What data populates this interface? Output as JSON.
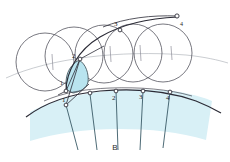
{
  "figure": {
    "caption": "B",
    "colors": {
      "stroke_dark": "#2b2b36",
      "stroke_circle": "#555560",
      "stroke_light": "#9aa0a6",
      "fill_sector": "#d8f0f6",
      "fill_small_region": "#b9e4ef",
      "node_fill": "#ffffff",
      "background": "#ffffff"
    },
    "base_curve_labels": [
      {
        "text": "1",
        "x": 62,
        "y": 101
      },
      {
        "text": "2",
        "x": 109,
        "y": 99
      },
      {
        "text": "3",
        "x": 139,
        "y": 98
      },
      {
        "text": "4",
        "x": 166,
        "y": 98
      }
    ],
    "upper_curve_labels": [
      {
        "text": "1",
        "x": 60,
        "y": 83
      },
      {
        "text": "2",
        "x": 72,
        "y": 56
      },
      {
        "text": "3",
        "x": 115,
        "y": 24
      },
      {
        "text": "4",
        "x": 181,
        "y": 27
      }
    ],
    "base_nodes": [
      {
        "name": "node-0",
        "x": 65,
        "y": 105
      },
      {
        "name": "node-1",
        "x": 90,
        "y": 93
      },
      {
        "name": "node-2",
        "x": 116,
        "y": 91
      },
      {
        "name": "node-3",
        "x": 143,
        "y": 91
      },
      {
        "name": "node-4",
        "x": 170,
        "y": 92
      }
    ],
    "upper_nodes": [
      {
        "name": "upper-node-1",
        "x": 66,
        "y": 90
      },
      {
        "name": "upper-node-2",
        "x": 79,
        "y": 59
      },
      {
        "name": "upper-node-3",
        "x": 120,
        "y": 30
      },
      {
        "name": "upper-node-4",
        "x": 177,
        "y": 17
      }
    ],
    "circles": [
      {
        "name": "circle-1",
        "cx": 45,
        "cy": 62,
        "r": 29
      },
      {
        "name": "circle-2",
        "cx": 74,
        "cy": 56,
        "r": 29
      },
      {
        "name": "circle-3",
        "cx": 104,
        "cy": 54,
        "r": 29
      },
      {
        "name": "circle-4",
        "cx": 133,
        "cy": 53,
        "r": 29
      },
      {
        "name": "circle-5",
        "cx": 163,
        "cy": 53,
        "r": 29
      }
    ],
    "radial_lines": 5
  }
}
